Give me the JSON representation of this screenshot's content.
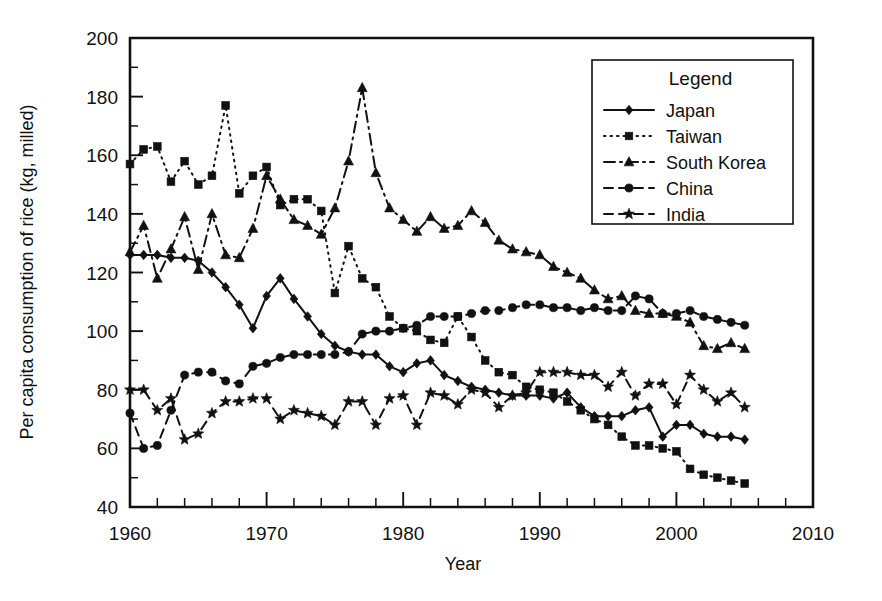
{
  "chart_data": {
    "type": "line",
    "title": "",
    "xlabel": "Year",
    "ylabel": "Per capita consumption of rice (kg, milled)",
    "xlim": [
      1960,
      2010
    ],
    "ylim": [
      40,
      200
    ],
    "x_major_ticks": [
      1960,
      1970,
      1980,
      1990,
      2000,
      2010
    ],
    "x_tick_labels": [
      "1960",
      "1970",
      "1980",
      "1990",
      "2000",
      "2010"
    ],
    "x_minor_step": 2,
    "y_major_ticks": [
      40,
      60,
      80,
      100,
      120,
      140,
      160,
      180,
      200
    ],
    "y_tick_labels": [
      "40",
      "60",
      "80",
      "100",
      "120",
      "140",
      "160",
      "180",
      "200"
    ],
    "y_minor_step": 10,
    "grid": false,
    "legend_position": "top-right",
    "legend_title": "Legend",
    "series": [
      {
        "name": "Japan",
        "marker": "diamond",
        "dash": "solid",
        "x": [
          1960,
          1961,
          1962,
          1963,
          1964,
          1965,
          1966,
          1967,
          1968,
          1969,
          1970,
          1971,
          1972,
          1973,
          1974,
          1975,
          1976,
          1977,
          1978,
          1979,
          1980,
          1981,
          1982,
          1983,
          1984,
          1985,
          1986,
          1987,
          1988,
          1989,
          1990,
          1991,
          1992,
          1993,
          1994,
          1995,
          1996,
          1997,
          1998,
          1999,
          2000,
          2001,
          2002,
          2003,
          2004,
          2005
        ],
        "values": [
          126,
          126,
          126,
          125,
          125,
          124,
          120,
          115,
          109,
          101,
          112,
          118,
          111,
          105,
          99,
          95,
          93,
          92,
          92,
          88,
          86,
          89,
          90,
          85,
          83,
          81,
          80,
          79,
          78,
          78,
          78,
          77,
          79,
          74,
          71,
          71,
          71,
          73,
          74,
          64,
          68,
          68,
          65,
          64,
          64,
          63
        ]
      },
      {
        "name": "Taiwan",
        "marker": "square",
        "dash": "dotted",
        "x": [
          1960,
          1961,
          1962,
          1963,
          1964,
          1965,
          1966,
          1967,
          1968,
          1969,
          1970,
          1971,
          1972,
          1973,
          1974,
          1975,
          1976,
          1977,
          1978,
          1979,
          1980,
          1981,
          1982,
          1983,
          1984,
          1985,
          1986,
          1987,
          1988,
          1989,
          1990,
          1991,
          1992,
          1993,
          1994,
          1995,
          1996,
          1997,
          1998,
          1999,
          2000,
          2001,
          2002,
          2003,
          2004,
          2005
        ],
        "values": [
          157,
          162,
          163,
          151,
          158,
          150,
          153,
          177,
          147,
          153,
          156,
          143,
          145,
          145,
          141,
          113,
          129,
          118,
          115,
          105,
          101,
          100,
          97,
          96,
          105,
          98,
          90,
          86,
          85,
          81,
          80,
          79,
          76,
          73,
          70,
          68,
          64,
          61,
          61,
          60,
          59,
          53,
          51,
          50,
          49,
          48
        ]
      },
      {
        "name": "South Korea",
        "marker": "triangle",
        "dash": "dashdot",
        "x": [
          1960,
          1961,
          1962,
          1963,
          1964,
          1965,
          1966,
          1967,
          1968,
          1969,
          1970,
          1971,
          1972,
          1973,
          1974,
          1975,
          1976,
          1977,
          1978,
          1979,
          1980,
          1981,
          1982,
          1983,
          1984,
          1985,
          1986,
          1987,
          1988,
          1989,
          1990,
          1991,
          1992,
          1993,
          1994,
          1995,
          1996,
          1997,
          1998,
          1999,
          2000,
          2001,
          2002,
          2003,
          2004,
          2005
        ],
        "values": [
          127,
          136,
          118,
          128,
          139,
          121,
          140,
          126,
          125,
          135,
          153,
          145,
          138,
          136,
          133,
          142,
          158,
          183,
          154,
          142,
          138,
          134,
          139,
          135,
          136,
          141,
          137,
          131,
          128,
          127,
          126,
          122,
          120,
          118,
          114,
          111,
          112,
          107,
          106,
          106,
          105,
          103,
          95,
          94,
          96,
          94
        ]
      },
      {
        "name": "China",
        "marker": "circle",
        "dash": "dashed",
        "x": [
          1960,
          1961,
          1962,
          1963,
          1964,
          1965,
          1966,
          1967,
          1968,
          1969,
          1970,
          1971,
          1972,
          1973,
          1974,
          1975,
          1976,
          1977,
          1978,
          1979,
          1980,
          1981,
          1982,
          1983,
          1984,
          1985,
          1986,
          1987,
          1988,
          1989,
          1990,
          1991,
          1992,
          1993,
          1994,
          1995,
          1996,
          1997,
          1998,
          1999,
          2000,
          2001,
          2002,
          2003,
          2004,
          2005
        ],
        "values": [
          72,
          60,
          61,
          73,
          85,
          86,
          86,
          83,
          82,
          88,
          89,
          91,
          92,
          92,
          92,
          92,
          93,
          99,
          100,
          100,
          101,
          102,
          105,
          105,
          105,
          106,
          107,
          107,
          108,
          109,
          109,
          108,
          108,
          107,
          108,
          107,
          107,
          112,
          111,
          106,
          106,
          107,
          105,
          104,
          103,
          102
        ]
      },
      {
        "name": "India",
        "marker": "star",
        "dash": "dashed",
        "x": [
          1960,
          1961,
          1962,
          1963,
          1964,
          1965,
          1966,
          1967,
          1968,
          1969,
          1970,
          1971,
          1972,
          1973,
          1974,
          1975,
          1976,
          1977,
          1978,
          1979,
          1980,
          1981,
          1982,
          1983,
          1984,
          1985,
          1986,
          1987,
          1988,
          1989,
          1990,
          1991,
          1992,
          1993,
          1994,
          1995,
          1996,
          1997,
          1998,
          1999,
          2000,
          2001,
          2002,
          2003,
          2004,
          2005
        ],
        "values": [
          80,
          80,
          73,
          77,
          63,
          65,
          72,
          76,
          76,
          77,
          77,
          70,
          73,
          72,
          71,
          68,
          76,
          76,
          68,
          77,
          78,
          68,
          79,
          78,
          75,
          80,
          79,
          74,
          78,
          79,
          86,
          86,
          86,
          85,
          85,
          81,
          86,
          78,
          82,
          82,
          75,
          85,
          80,
          76,
          79,
          74
        ]
      }
    ]
  }
}
